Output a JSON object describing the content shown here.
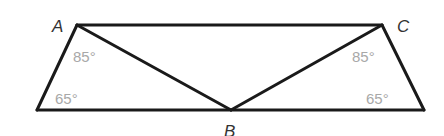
{
  "diagram": {
    "type": "geometry-trapezoid",
    "vertices": {
      "A": {
        "label": "A",
        "x": 77,
        "y": 25
      },
      "C": {
        "label": "C",
        "x": 382,
        "y": 25
      },
      "B": {
        "label": "B",
        "x": 231,
        "y": 110
      },
      "BL": {
        "x": 37,
        "y": 110
      },
      "BR": {
        "x": 424,
        "y": 110
      }
    },
    "angles": {
      "left_top": "85°",
      "left_bottom": "65°",
      "right_top": "85°",
      "right_bottom": "65°"
    },
    "colors": {
      "edge": "#1a1a1a",
      "vertex_label": "#333333",
      "angle_label": "#a8a8a8"
    }
  }
}
